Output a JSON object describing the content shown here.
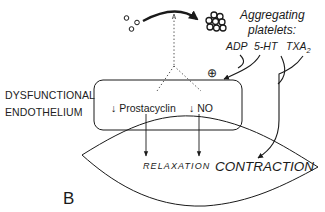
{
  "diagram": {
    "panel_label": "B",
    "side_label": {
      "line1": "DYSFUNCTIONAL",
      "line2": "ENDOTHELIUM"
    },
    "platelets": {
      "title_line1": "Aggregating",
      "title_line2": "platelets:",
      "mediators": {
        "adp": "ADP",
        "serotonin": "5-HT",
        "thromboxane_base": "TXA",
        "thromboxane_sub": "2"
      }
    },
    "endothelium_box": {
      "item1": "↓ Prostacyclin",
      "item2": "↓ NO",
      "stimulation_sign": "⊕"
    },
    "smooth_muscle": {
      "relaxation": "RELAXATION",
      "contraction": "CONTRACTION"
    },
    "colors": {
      "stroke": "#1a1a1a",
      "background": "#ffffff"
    }
  }
}
